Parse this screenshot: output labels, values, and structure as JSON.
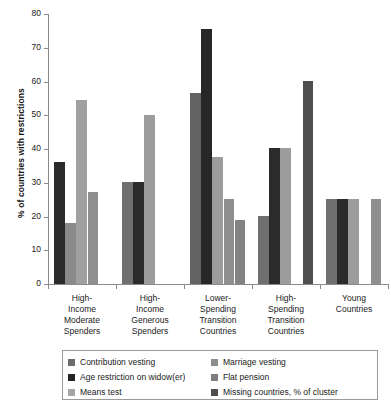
{
  "chart_data": {
    "type": "bar",
    "title": "",
    "xlabel": "",
    "ylabel": "% of countries with restrictions",
    "ylim": [
      0,
      80
    ],
    "ytick_values": [
      0,
      10,
      20,
      30,
      40,
      50,
      60,
      70,
      80
    ],
    "ytick_labels": [
      "0",
      "10",
      "20",
      "30",
      "40",
      "50",
      "60",
      "70",
      "80"
    ],
    "grid": false,
    "legend_position": "bottom",
    "categories": [
      "High-Income Moderate Spenders",
      "High-Income Generous Spenders",
      "Lower-Spending Transition Countries",
      "High-Spending Transition Countries",
      "Young Countries"
    ],
    "category_label_lines": [
      [
        "High-",
        "Income",
        "Moderate",
        "Spenders"
      ],
      [
        "High-",
        "Income",
        "Generous",
        "Spenders"
      ],
      [
        "Lower-",
        "Spending",
        "Transition",
        "Countries"
      ],
      [
        "High-",
        "Spending",
        "Transition",
        "Countries"
      ],
      [
        "Young",
        "Countries"
      ]
    ],
    "series": [
      {
        "name": "Contribution vesting",
        "color": "#6b6b6b",
        "values": [
          null,
          30.2,
          56.5,
          20.2,
          25.3
        ]
      },
      {
        "name": "Age restriction on widow(er)",
        "color": "#242424",
        "values": [
          36.3,
          30.2,
          75.5,
          40.2,
          25.3
        ]
      },
      {
        "name": "Means test",
        "color": "#a5a5a5",
        "values": [
          18.2,
          50.1,
          37.5,
          40.2,
          25.3
        ]
      },
      {
        "name": "Marriage vesting",
        "color": "#909090",
        "values": [
          54.5,
          null,
          25.2,
          null,
          null
        ]
      },
      {
        "name": "Flat pension",
        "color": "#808080",
        "values": [
          27.3,
          null,
          19.0,
          null,
          25.3
        ]
      },
      {
        "name": "Missing countries, % of cluster",
        "color": "#4f4f4f",
        "values": [
          null,
          null,
          null,
          60.3,
          null
        ]
      }
    ],
    "bar_slots": [
      [
        {
          "series": "Age restriction on widow(er)",
          "value": 36.3,
          "color": "#2b2b2b",
          "slot": 0
        },
        {
          "series": "Means test",
          "value": 18.2,
          "color": "#8a8a8a",
          "slot": 1
        },
        {
          "series": "Marriage vesting",
          "value": 54.5,
          "color": "#a0a0a0",
          "slot": 2
        },
        {
          "series": "Flat pension",
          "value": 27.3,
          "color": "#8f8f8f",
          "slot": 3
        }
      ],
      [
        {
          "series": "Contribution vesting",
          "value": 30.2,
          "color": "#707070",
          "slot": 0
        },
        {
          "series": "Age restriction on widow(er)",
          "value": 30.2,
          "color": "#2b2b2b",
          "slot": 1
        },
        {
          "series": "Means test",
          "value": 50.1,
          "color": "#9c9c9c",
          "slot": 2
        }
      ],
      [
        {
          "series": "Contribution vesting",
          "value": 56.5,
          "color": "#636363",
          "slot": 0
        },
        {
          "series": "Age restriction on widow(er)",
          "value": 75.5,
          "color": "#272727",
          "slot": 1
        },
        {
          "series": "Means test",
          "value": 37.5,
          "color": "#9c9c9c",
          "slot": 2
        },
        {
          "series": "Marriage vesting",
          "value": 25.2,
          "color": "#8f8f8f",
          "slot": 3
        },
        {
          "series": "Flat pension",
          "value": 19.0,
          "color": "#838383",
          "slot": 4
        }
      ],
      [
        {
          "series": "Contribution vesting",
          "value": 20.2,
          "color": "#707070",
          "slot": 0
        },
        {
          "series": "Age restriction on widow(er)",
          "value": 40.2,
          "color": "#2b2b2b",
          "slot": 1
        },
        {
          "series": "Means test",
          "value": 40.2,
          "color": "#9c9c9c",
          "slot": 2
        },
        {
          "series": "Missing countries, % of cluster",
          "value": 60.3,
          "color": "#4f4f4f",
          "slot": 4
        }
      ],
      [
        {
          "series": "Contribution vesting",
          "value": 25.3,
          "color": "#707070",
          "slot": 0
        },
        {
          "series": "Age restriction on widow(er)",
          "value": 25.3,
          "color": "#2b2b2b",
          "slot": 1
        },
        {
          "series": "Means test",
          "value": 25.3,
          "color": "#9c9c9c",
          "slot": 2
        },
        {
          "series": "Flat pension",
          "value": 25.3,
          "color": "#8f8f8f",
          "slot": 4
        }
      ]
    ]
  },
  "legend": {
    "left_column": [
      {
        "label": "Contribution vesting",
        "color": "#6b6b6b"
      },
      {
        "label": "Age restriction on widow(er)",
        "color": "#242424"
      },
      {
        "label": "Means test",
        "color": "#a5a5a5"
      }
    ],
    "right_column": [
      {
        "label": "Marriage vesting",
        "color": "#8d8d8d"
      },
      {
        "label": "Flat pension",
        "color": "#7f7f7f"
      },
      {
        "label": "Missing countries, % of cluster",
        "color": "#4f4f4f"
      }
    ]
  },
  "colors": {
    "axis": "#8a8a8a",
    "text": "#1a1a1a",
    "background": "#ffffff",
    "legend_border": "#9a9a9a"
  }
}
